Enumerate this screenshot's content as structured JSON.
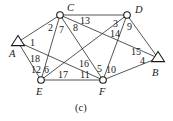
{
  "caption": "(c)",
  "nodes": [
    {
      "id": "A",
      "label": "A",
      "shape": "triangle",
      "x": 18,
      "y": 42,
      "lx": 9,
      "ly": 57
    },
    {
      "id": "C",
      "label": "C",
      "shape": "circle",
      "x": 60,
      "y": 15,
      "lx": 67,
      "ly": 11
    },
    {
      "id": "D",
      "label": "D",
      "shape": "circle",
      "x": 127,
      "y": 15,
      "lx": 135,
      "ly": 13
    },
    {
      "id": "B",
      "label": "B",
      "shape": "triangle",
      "x": 158,
      "y": 58,
      "lx": 152,
      "ly": 76
    },
    {
      "id": "E",
      "label": "E",
      "shape": "circle",
      "x": 41,
      "y": 80,
      "lx": 36,
      "ly": 95
    },
    {
      "id": "F",
      "label": "F",
      "shape": "circle",
      "x": 103,
      "y": 80,
      "lx": 99,
      "ly": 95
    }
  ],
  "edges": [
    {
      "from": "A",
      "to": "C"
    },
    {
      "from": "A",
      "to": "E"
    },
    {
      "from": "A",
      "to": "F"
    },
    {
      "from": "C",
      "to": "D"
    },
    {
      "from": "C",
      "to": "E"
    },
    {
      "from": "C",
      "to": "F"
    },
    {
      "from": "C",
      "to": "B"
    },
    {
      "from": "D",
      "to": "E"
    },
    {
      "from": "D",
      "to": "F"
    },
    {
      "from": "D",
      "to": "B"
    },
    {
      "from": "E",
      "to": "F"
    },
    {
      "from": "F",
      "to": "B"
    }
  ],
  "labels": [
    {
      "text": "1",
      "x": 30,
      "y": 46
    },
    {
      "text": "2",
      "x": 48,
      "y": 31
    },
    {
      "text": "7",
      "x": 59,
      "y": 33
    },
    {
      "text": "8",
      "x": 73,
      "y": 31
    },
    {
      "text": "13",
      "x": 80,
      "y": 24
    },
    {
      "text": "3",
      "x": 113,
      "y": 27
    },
    {
      "text": "9",
      "x": 127,
      "y": 30
    },
    {
      "text": "14",
      "x": 110,
      "y": 37
    },
    {
      "text": "15",
      "x": 131,
      "y": 55
    },
    {
      "text": "4",
      "x": 140,
      "y": 64
    },
    {
      "text": "18",
      "x": 30,
      "y": 62
    },
    {
      "text": "12",
      "x": 31,
      "y": 73
    },
    {
      "text": "6",
      "x": 44,
      "y": 73
    },
    {
      "text": "16",
      "x": 79,
      "y": 67
    },
    {
      "text": "5",
      "x": 97,
      "y": 72
    },
    {
      "text": "10",
      "x": 106,
      "y": 73
    },
    {
      "text": "17",
      "x": 58,
      "y": 78
    },
    {
      "text": "11",
      "x": 80,
      "y": 78
    }
  ]
}
